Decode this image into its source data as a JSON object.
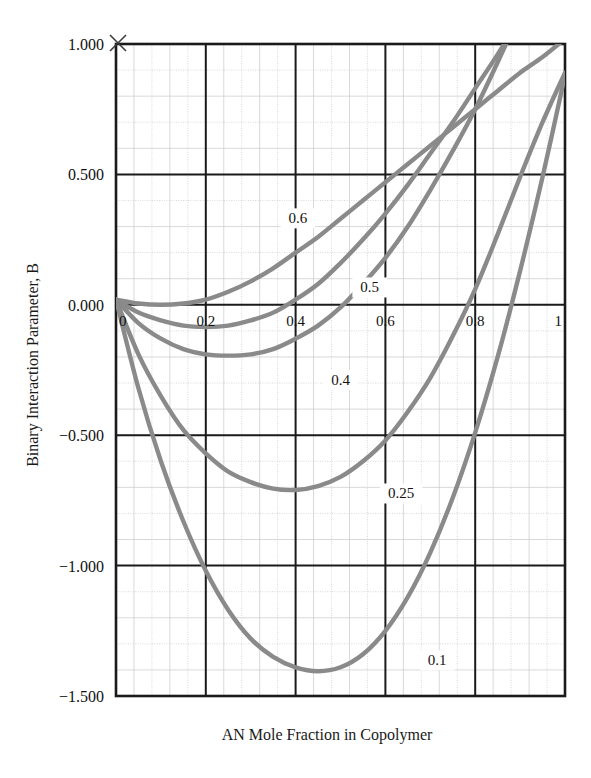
{
  "chart_data": {
    "type": "line",
    "title": "",
    "xlabel": "AN Mole Fraction in Copolymer",
    "ylabel": "Binary Interaction Parameter, B",
    "xlim": [
      0,
      1
    ],
    "ylim": [
      -1.5,
      1.0
    ],
    "xticks": [
      "0",
      "0.2",
      "0.4",
      "0.6",
      "0.8",
      "1"
    ],
    "xtick_values": [
      0,
      0.2,
      0.4,
      0.6,
      0.8,
      1
    ],
    "yticks": [
      "1.000",
      "0.500",
      "0.000",
      "−0.500",
      "−1.000",
      "−1.500"
    ],
    "ytick_values": [
      1.0,
      0.5,
      0.0,
      -0.5,
      -1.0,
      -1.5
    ],
    "grid": "major and minor gridlines, 5 minor divisions per major",
    "legend_position": "inline curve labels",
    "line_color": "#8a8a8a",
    "axis_color": "#1a1a1a",
    "grid_major_color": "#9a9a9a",
    "grid_minor_color": "#c9c9c9",
    "corner_marker": "x",
    "series": [
      {
        "name": "0.6",
        "label": "0.6",
        "label_x": 0.405,
        "label_y": 0.32,
        "x": [
          0.0,
          0.05,
          0.1,
          0.15,
          0.2,
          0.25,
          0.3,
          0.35,
          0.4,
          0.45,
          0.5,
          0.55,
          0.6,
          0.65,
          0.7,
          0.75,
          0.8,
          0.85,
          0.9,
          0.95,
          1.0
        ],
        "values": [
          0.02,
          0.005,
          0.0,
          0.005,
          0.02,
          0.05,
          0.09,
          0.14,
          0.2,
          0.26,
          0.33,
          0.4,
          0.47,
          0.54,
          0.61,
          0.68,
          0.75,
          0.82,
          0.89,
          0.95,
          1.02
        ]
      },
      {
        "name": "0.5",
        "label": "0.5",
        "label_x": 0.565,
        "label_y": 0.055,
        "x": [
          0.0,
          0.05,
          0.1,
          0.15,
          0.2,
          0.25,
          0.3,
          0.35,
          0.4,
          0.45,
          0.5,
          0.55,
          0.6,
          0.65,
          0.7,
          0.75,
          0.8,
          0.85,
          0.9,
          0.95,
          1.0
        ],
        "values": [
          0.02,
          -0.03,
          -0.06,
          -0.08,
          -0.085,
          -0.08,
          -0.06,
          -0.03,
          0.02,
          0.08,
          0.16,
          0.25,
          0.35,
          0.46,
          0.58,
          0.7,
          0.83,
          0.96,
          1.1,
          1.24,
          1.38
        ]
      },
      {
        "name": "0.4",
        "label": "0.4",
        "label_x": 0.5,
        "label_y": -0.3,
        "x": [
          0.0,
          0.05,
          0.1,
          0.15,
          0.2,
          0.25,
          0.3,
          0.35,
          0.4,
          0.45,
          0.5,
          0.55,
          0.6,
          0.65,
          0.7,
          0.75,
          0.8,
          0.85,
          0.9,
          0.95,
          1.0
        ],
        "values": [
          0.02,
          -0.07,
          -0.13,
          -0.17,
          -0.19,
          -0.195,
          -0.19,
          -0.17,
          -0.13,
          -0.08,
          -0.01,
          0.08,
          0.18,
          0.3,
          0.44,
          0.59,
          0.75,
          0.93,
          1.12,
          1.32,
          1.53
        ]
      },
      {
        "name": "0.25",
        "label": "0.25",
        "label_x": 0.635,
        "label_y": -0.735,
        "x": [
          0.0,
          0.05,
          0.1,
          0.15,
          0.2,
          0.25,
          0.3,
          0.35,
          0.4,
          0.45,
          0.5,
          0.55,
          0.6,
          0.65,
          0.7,
          0.75,
          0.8,
          0.85,
          0.9,
          0.95,
          1.0
        ],
        "values": [
          0.02,
          -0.19,
          -0.35,
          -0.48,
          -0.57,
          -0.64,
          -0.68,
          -0.705,
          -0.71,
          -0.695,
          -0.66,
          -0.6,
          -0.52,
          -0.41,
          -0.28,
          -0.12,
          0.06,
          0.27,
          0.49,
          0.7,
          0.89
        ]
      },
      {
        "name": "0.1",
        "label": "0.1",
        "label_x": 0.715,
        "label_y": -1.375,
        "x": [
          0.0,
          0.05,
          0.1,
          0.15,
          0.2,
          0.25,
          0.3,
          0.35,
          0.4,
          0.45,
          0.5,
          0.55,
          0.6,
          0.65,
          0.7,
          0.75,
          0.8,
          0.85,
          0.9,
          0.95,
          1.0
        ],
        "values": [
          0.02,
          -0.32,
          -0.6,
          -0.83,
          -1.02,
          -1.17,
          -1.28,
          -1.35,
          -1.39,
          -1.405,
          -1.39,
          -1.34,
          -1.25,
          -1.12,
          -0.95,
          -0.74,
          -0.49,
          -0.2,
          0.13,
          0.49,
          0.88
        ]
      }
    ]
  },
  "axes": {
    "x_axis_title": "AN Mole Fraction in Copolymer",
    "y_axis_title": "Binary Interaction Parameter, B"
  }
}
